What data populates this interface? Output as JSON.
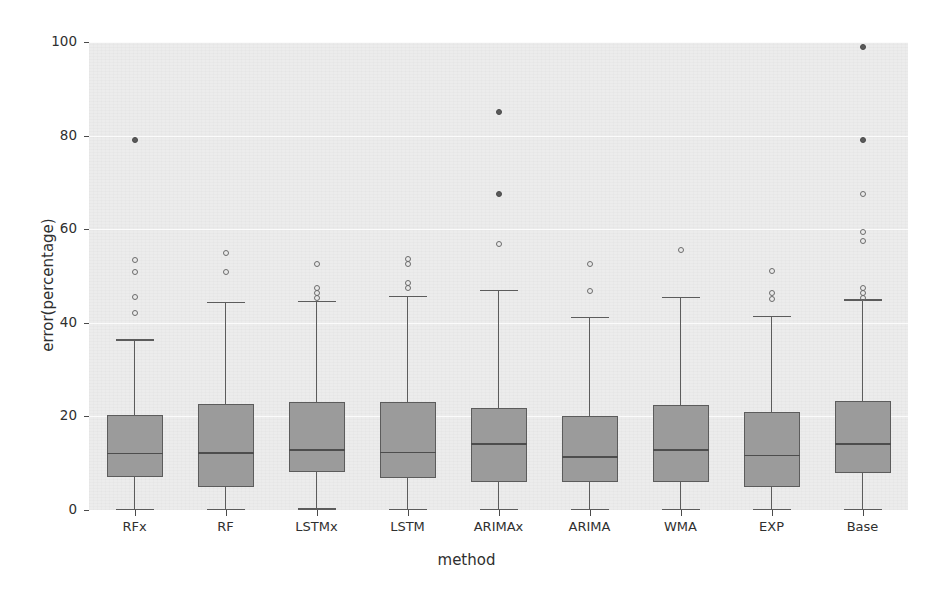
{
  "chart_data": {
    "type": "box",
    "title": "",
    "xlabel": "method",
    "ylabel": "error(percentage)",
    "ylim": [
      0,
      100
    ],
    "yticks": [
      0,
      20,
      40,
      60,
      80,
      100
    ],
    "grid": true,
    "legend": "none",
    "categories": [
      "RFx",
      "RF",
      "LSTMx",
      "LSTM",
      "ARIMAx",
      "ARIMA",
      "WMA",
      "EXP",
      "Base"
    ],
    "boxes": [
      {
        "label": "RFx",
        "whisker_low": 0.3,
        "q1": 7.0,
        "median": 12.2,
        "q3": 20.2,
        "whisker_high": 36.5,
        "outliers": [
          42.0,
          45.5,
          50.8,
          53.5
        ],
        "filled_outliers": [
          79.0
        ]
      },
      {
        "label": "RF",
        "whisker_low": 0.3,
        "q1": 5.0,
        "median": 12.3,
        "q3": 22.7,
        "whisker_high": 44.5,
        "outliers": [
          50.8,
          55.0
        ],
        "filled_outliers": []
      },
      {
        "label": "LSTMx",
        "whisker_low": 0.4,
        "q1": 8.2,
        "median": 13.0,
        "q3": 23.0,
        "whisker_high": 44.7,
        "outliers": [
          45.2,
          46.3,
          47.4,
          52.5
        ],
        "filled_outliers": []
      },
      {
        "label": "LSTM",
        "whisker_low": 0.3,
        "q1": 6.8,
        "median": 12.5,
        "q3": 23.0,
        "whisker_high": 45.8,
        "outliers": [
          47.5,
          48.6,
          52.6,
          53.6
        ],
        "filled_outliers": []
      },
      {
        "label": "ARIMAx",
        "whisker_low": 0.3,
        "q1": 6.0,
        "median": 14.3,
        "q3": 21.7,
        "whisker_high": 47.0,
        "outliers": [
          56.8
        ],
        "filled_outliers": [
          67.5,
          85.0
        ]
      },
      {
        "label": "ARIMA",
        "whisker_low": 0.3,
        "q1": 6.0,
        "median": 11.5,
        "q3": 20.0,
        "whisker_high": 41.3,
        "outliers": [
          46.8,
          52.5
        ],
        "filled_outliers": []
      },
      {
        "label": "WMA",
        "whisker_low": 0.3,
        "q1": 6.0,
        "median": 13.0,
        "q3": 22.5,
        "whisker_high": 45.5,
        "outliers": [
          55.5
        ],
        "filled_outliers": []
      },
      {
        "label": "EXP",
        "whisker_low": 0.3,
        "q1": 5.0,
        "median": 11.8,
        "q3": 21.0,
        "whisker_high": 41.5,
        "outliers": [
          45.0,
          46.4,
          51.0
        ],
        "filled_outliers": []
      },
      {
        "label": "Base",
        "whisker_low": 0.3,
        "q1": 8.0,
        "median": 14.3,
        "q3": 23.3,
        "whisker_high": 45.0,
        "outliers": [
          45.2,
          46.3,
          47.5,
          57.5,
          59.5,
          67.5
        ],
        "filled_outliers": [
          79.0,
          99.0
        ]
      }
    ]
  }
}
